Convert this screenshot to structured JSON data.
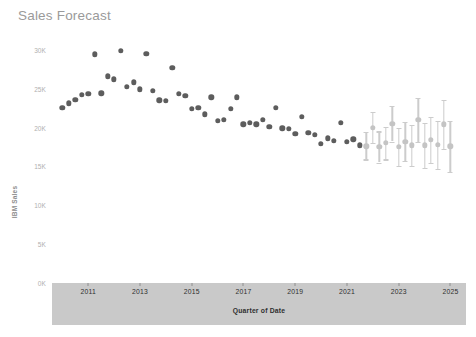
{
  "chart": {
    "title": "Sales Forecast"
  },
  "chart_data": {
    "type": "scatter",
    "title": "Sales Forecast",
    "xlabel": "Quarter of Date",
    "ylabel": "IBM Sales",
    "ylim": [
      0,
      31000
    ],
    "xlim": [
      2009.6,
      2025.6
    ],
    "grid": false,
    "legend": null,
    "yticks": [
      {
        "value": 30000,
        "label": "30K"
      },
      {
        "value": 25000,
        "label": "25K"
      },
      {
        "value": 20000,
        "label": "20K"
      },
      {
        "value": 15000,
        "label": "15K"
      },
      {
        "value": 10000,
        "label": "10K"
      },
      {
        "value": 5000,
        "label": "5K"
      },
      {
        "value": 0,
        "label": "0K"
      }
    ],
    "xticks": [
      {
        "value": 2011,
        "label": "2011"
      },
      {
        "value": 2013,
        "label": "2013"
      },
      {
        "value": 2015,
        "label": "2015"
      },
      {
        "value": 2017,
        "label": "2017"
      },
      {
        "value": 2019,
        "label": "2019"
      },
      {
        "value": 2021,
        "label": "2021"
      },
      {
        "value": 2023,
        "label": "2023"
      },
      {
        "value": 2025,
        "label": "2025"
      }
    ],
    "series": [
      {
        "name": "Actual",
        "kind": "scatter",
        "color": "#5d5d5d",
        "points": [
          {
            "x": 2010.0,
            "y": 22500
          },
          {
            "x": 2010.25,
            "y": 23100
          },
          {
            "x": 2010.5,
            "y": 23600
          },
          {
            "x": 2010.75,
            "y": 24200
          },
          {
            "x": 2011.0,
            "y": 24300
          },
          {
            "x": 2011.25,
            "y": 29400
          },
          {
            "x": 2011.5,
            "y": 24400
          },
          {
            "x": 2011.75,
            "y": 26600
          },
          {
            "x": 2012.0,
            "y": 26200
          },
          {
            "x": 2012.25,
            "y": 29900
          },
          {
            "x": 2012.5,
            "y": 25200
          },
          {
            "x": 2012.75,
            "y": 25800
          },
          {
            "x": 2013.0,
            "y": 24900
          },
          {
            "x": 2013.25,
            "y": 29500
          },
          {
            "x": 2013.5,
            "y": 24700
          },
          {
            "x": 2013.75,
            "y": 23500
          },
          {
            "x": 2014.0,
            "y": 23400
          },
          {
            "x": 2014.25,
            "y": 27700
          },
          {
            "x": 2014.5,
            "y": 24300
          },
          {
            "x": 2014.75,
            "y": 24100
          },
          {
            "x": 2015.0,
            "y": 22400
          },
          {
            "x": 2015.25,
            "y": 22500
          },
          {
            "x": 2015.5,
            "y": 21700
          },
          {
            "x": 2015.75,
            "y": 23900
          },
          {
            "x": 2016.0,
            "y": 20900
          },
          {
            "x": 2016.25,
            "y": 21000
          },
          {
            "x": 2016.5,
            "y": 22400
          },
          {
            "x": 2016.75,
            "y": 23900
          },
          {
            "x": 2017.0,
            "y": 20400
          },
          {
            "x": 2017.25,
            "y": 20600
          },
          {
            "x": 2017.5,
            "y": 20400
          },
          {
            "x": 2017.75,
            "y": 21000
          },
          {
            "x": 2018.0,
            "y": 20100
          },
          {
            "x": 2018.25,
            "y": 22500
          },
          {
            "x": 2018.5,
            "y": 19900
          },
          {
            "x": 2018.75,
            "y": 19800
          },
          {
            "x": 2019.0,
            "y": 19200
          },
          {
            "x": 2019.25,
            "y": 21400
          },
          {
            "x": 2019.5,
            "y": 19300
          },
          {
            "x": 2019.75,
            "y": 19100
          },
          {
            "x": 2020.0,
            "y": 17900
          },
          {
            "x": 2020.25,
            "y": 18600
          },
          {
            "x": 2020.5,
            "y": 18300
          },
          {
            "x": 2020.75,
            "y": 20600
          },
          {
            "x": 2021.0,
            "y": 18200
          },
          {
            "x": 2021.25,
            "y": 18500
          },
          {
            "x": 2021.5,
            "y": 17700
          }
        ]
      },
      {
        "name": "Forecast",
        "kind": "scatter-errorbar",
        "color": "#c4c4c4",
        "points": [
          {
            "x": 2021.75,
            "y": 17600,
            "low": 15900,
            "high": 19400
          },
          {
            "x": 2022.0,
            "y": 20000,
            "low": 18000,
            "high": 22000
          },
          {
            "x": 2022.25,
            "y": 17500,
            "low": 15500,
            "high": 19500
          },
          {
            "x": 2022.5,
            "y": 18000,
            "low": 15900,
            "high": 20100
          },
          {
            "x": 2022.75,
            "y": 20500,
            "low": 18200,
            "high": 22800
          },
          {
            "x": 2023.0,
            "y": 17500,
            "low": 15100,
            "high": 19900
          },
          {
            "x": 2023.25,
            "y": 18200,
            "low": 15700,
            "high": 20700
          },
          {
            "x": 2023.5,
            "y": 17700,
            "low": 15100,
            "high": 20300
          },
          {
            "x": 2023.75,
            "y": 21000,
            "low": 18200,
            "high": 23800
          },
          {
            "x": 2024.0,
            "y": 17700,
            "low": 14800,
            "high": 20600
          },
          {
            "x": 2024.25,
            "y": 18400,
            "low": 15400,
            "high": 21400
          },
          {
            "x": 2024.5,
            "y": 17800,
            "low": 14700,
            "high": 20900
          },
          {
            "x": 2024.75,
            "y": 20400,
            "low": 17200,
            "high": 23600
          },
          {
            "x": 2025.0,
            "y": 17600,
            "low": 14300,
            "high": 20900
          }
        ]
      }
    ]
  }
}
